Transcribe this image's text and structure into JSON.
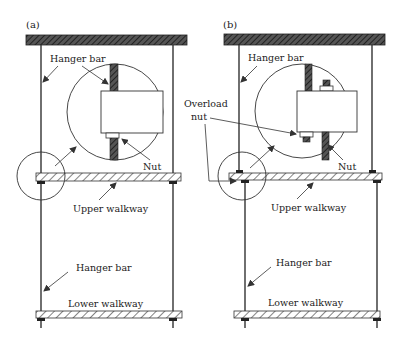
{
  "panels": [
    {
      "id": "a",
      "label": "(a)",
      "callouts": {
        "hanger_bar_top": "Hanger bar",
        "nut": "Nut",
        "upper_walkway": "Upper walkway",
        "hanger_bar_bottom": "Hanger bar",
        "lower_walkway": "Lower walkway"
      }
    },
    {
      "id": "b",
      "label": "(b)",
      "callouts": {
        "hanger_bar_top": "Hanger bar",
        "overload_line1": "Overload",
        "overload_line2": "nut",
        "nut": "Nut",
        "upper_walkway": "Upper walkway",
        "hanger_bar_bottom": "Hanger bar",
        "lower_walkway": "Lower walkway"
      }
    }
  ],
  "colors": {
    "line": "#333333",
    "dark_hatch": "#3a3a3a",
    "background": "#ffffff"
  }
}
